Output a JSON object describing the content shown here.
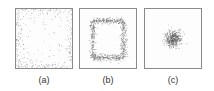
{
  "figure": {
    "panels": [
      {
        "id": "a",
        "label": "(a)",
        "distribution": "edge-concentrated",
        "left": 15
      },
      {
        "id": "b",
        "label": "(b)",
        "distribution": "inset-square-ring",
        "left": 79
      },
      {
        "id": "c",
        "label": "(c)",
        "distribution": "central-gaussian-cluster",
        "left": 144
      }
    ],
    "colors": {
      "dot": "#555555",
      "border": "#8a8a8a",
      "background": "#ffffff"
    }
  }
}
